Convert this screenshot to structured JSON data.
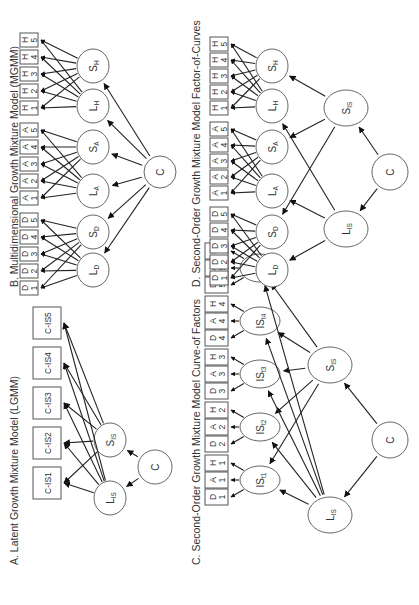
{
  "figure": {
    "orientation": "rotated-90-ccw",
    "panels": [
      {
        "id": "A",
        "title": "A. Latent Growth Mixture Model (LGMM)",
        "indicators": [
          "C-IS1",
          "C-IS2",
          "C-IS3",
          "C-IS4",
          "C-IS5"
        ],
        "latent_factors": [
          {
            "name": "L",
            "sub": "IS"
          },
          {
            "name": "S",
            "sub": "IS"
          }
        ],
        "class_node": "C"
      },
      {
        "id": "B",
        "title": "B. Multidimensional Growth Mixture Model (MGMM)",
        "indicator_groups": [
          {
            "letter": "D",
            "items": [
              "1",
              "2",
              "3",
              "4",
              "5"
            ]
          },
          {
            "letter": "A",
            "items": [
              "1",
              "2",
              "3",
              "4",
              "5"
            ]
          },
          {
            "letter": "H",
            "items": [
              "1",
              "2",
              "3",
              "4",
              "5"
            ]
          }
        ],
        "latent_factors": [
          {
            "name": "L",
            "sub": "D"
          },
          {
            "name": "S",
            "sub": "D"
          },
          {
            "name": "L",
            "sub": "A"
          },
          {
            "name": "S",
            "sub": "A"
          },
          {
            "name": "L",
            "sub": "H"
          },
          {
            "name": "S",
            "sub": "H"
          }
        ],
        "class_node": "C"
      },
      {
        "id": "C",
        "title": "C. Second-Order Growth Mixture Model Curve-of Factors",
        "indicator_groups": [
          {
            "wave": "1",
            "items": [
              "D",
              "A",
              "H"
            ]
          },
          {
            "wave": "2",
            "items": [
              "D",
              "A",
              "H"
            ]
          },
          {
            "wave": "3",
            "items": [
              "D",
              "A",
              "H"
            ]
          },
          {
            "wave": "4",
            "items": [
              "D",
              "A",
              "H"
            ]
          },
          {
            "wave": "5",
            "items": [
              "D",
              "A",
              "H"
            ]
          }
        ],
        "first_order_factors": [
          {
            "name": "IS",
            "sub": "t1"
          },
          {
            "name": "IS",
            "sub": "t2"
          },
          {
            "name": "IS",
            "sub": "t3"
          },
          {
            "name": "IS",
            "sub": "t4"
          },
          {
            "name": "IS",
            "sub": "t5"
          }
        ],
        "second_order_factors": [
          {
            "name": "L",
            "sub": "IS"
          },
          {
            "name": "S",
            "sub": "IS"
          }
        ],
        "class_node": "C"
      },
      {
        "id": "D",
        "title": "D. Second-Order Growth Mixture Model Factor-of-Curves",
        "indicator_groups": [
          {
            "letter": "D",
            "items": [
              "1",
              "2",
              "3",
              "4",
              "5"
            ]
          },
          {
            "letter": "A",
            "items": [
              "1",
              "2",
              "3",
              "4",
              "5"
            ]
          },
          {
            "letter": "H",
            "items": [
              "1",
              "2",
              "3",
              "4",
              "5"
            ]
          }
        ],
        "first_order_factors": [
          {
            "name": "L",
            "sub": "D"
          },
          {
            "name": "S",
            "sub": "D"
          },
          {
            "name": "L",
            "sub": "A"
          },
          {
            "name": "S",
            "sub": "A"
          },
          {
            "name": "L",
            "sub": "H"
          },
          {
            "name": "S",
            "sub": "H"
          }
        ],
        "second_order_factors": [
          {
            "name": "L",
            "sub": "IS"
          },
          {
            "name": "S",
            "sub": "IS"
          }
        ],
        "class_node": "C"
      }
    ]
  }
}
